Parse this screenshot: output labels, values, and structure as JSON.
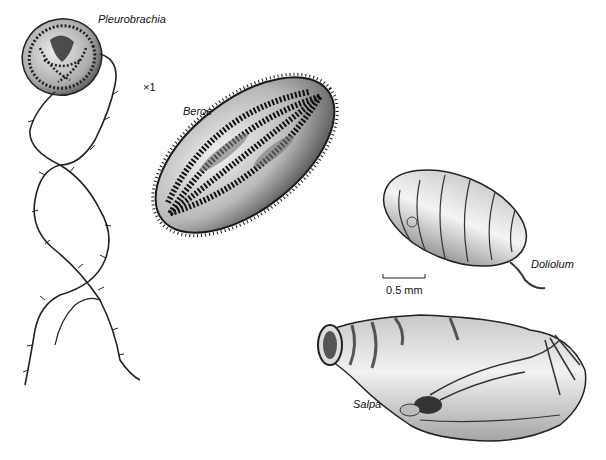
{
  "figure": {
    "background": "#ffffff",
    "ink_color": "#1a1a1a",
    "organisms": [
      {
        "id": "pleurobrachia",
        "label": "Pleurobrachia"
      },
      {
        "id": "beroe",
        "label": "Beroe"
      },
      {
        "id": "doliolum",
        "label": "Doliolum"
      },
      {
        "id": "salpa",
        "label": "Salpa"
      }
    ],
    "magnification": "×1",
    "scale_bar": {
      "label": "0.5 mm"
    }
  }
}
